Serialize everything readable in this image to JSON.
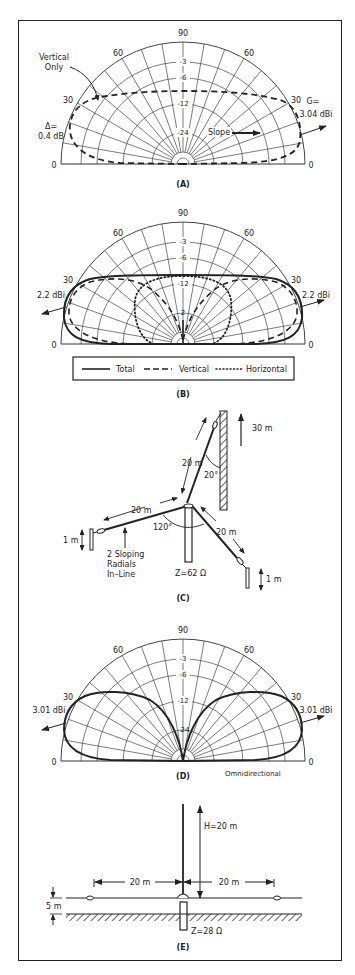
{
  "figure": {
    "panels": [
      {
        "id": "A",
        "caption": "(A)",
        "angle_labels": {
          "top": "90",
          "left60": "60",
          "right60": "60",
          "left30": "30",
          "right30": "30",
          "left0": "0",
          "right0": "0"
        },
        "ring_labels": [
          "-3",
          "-6",
          "-12",
          "-24"
        ],
        "annotations": {
          "vertical_only_line1": "Vertical",
          "vertical_only_line2": "Only",
          "delta_line1": "Δ=",
          "delta_line2": "0.4 dB",
          "gain_line1": "G=",
          "gain_line2": "3.04 dBi",
          "slope": "Slope"
        }
      },
      {
        "id": "B",
        "caption": "(B)",
        "angle_labels": {
          "top": "90",
          "left60": "60",
          "right60": "60",
          "left30": "30",
          "right30": "30",
          "left0": "0",
          "right0": "0"
        },
        "ring_labels": [
          "-3",
          "-6",
          "-12",
          "-24"
        ],
        "annotations": {
          "left_gain": "2.2 dBi",
          "right_gain": "2.2 dBi"
        },
        "legend": [
          {
            "label": "Total",
            "style": "solid"
          },
          {
            "label": "Vertical",
            "style": "dashed"
          },
          {
            "label": "Horizontal",
            "style": "dotted"
          }
        ]
      },
      {
        "id": "C",
        "caption": "(C)",
        "annotations": {
          "tower_height": "30 m",
          "sloper_length": "20 m",
          "sloper_angle": "20°",
          "radial_left_length": "20 m",
          "radial_right_length": "20 m",
          "radial_angle": "120°",
          "left_height": "1 m",
          "right_height": "1 m",
          "radials_note_line1": "2 Sloping",
          "radials_note_line2": "Radials",
          "radials_note_line3": "In–Line",
          "impedance": "Z=62  Ω"
        }
      },
      {
        "id": "D",
        "caption": "(D)",
        "angle_labels": {
          "top": "90",
          "left60": "60",
          "right60": "60",
          "left30": "30",
          "right30": "30",
          "left0": "0",
          "right0": "0"
        },
        "ring_labels": [
          "-3",
          "-6",
          "-12",
          "-24"
        ],
        "annotations": {
          "left_gain": "3.01 dBi",
          "right_gain": "3.01 dBi",
          "note": "Omnidirectional"
        }
      },
      {
        "id": "E",
        "caption": "(E)",
        "annotations": {
          "height": "H=20 m",
          "left_length": "20 m",
          "right_length": "20 m",
          "elevation": "5 m",
          "impedance": "Z=28  Ω"
        }
      }
    ]
  },
  "colors": {
    "ink": "#222222",
    "background": "#ffffff"
  }
}
